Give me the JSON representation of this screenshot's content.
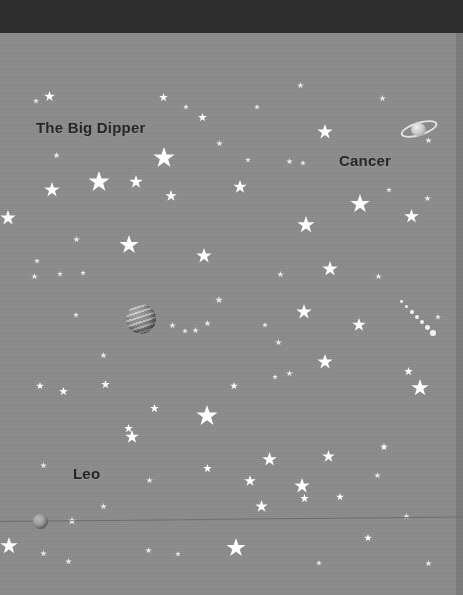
{
  "scene": {
    "title": "Night Sky Constellation Scene",
    "width": 463,
    "height": 595,
    "background_color": "#8b8b8c",
    "top_band_color": "#2e2e2e",
    "right_strip_color": "#7c7c7d",
    "star_color": "#fdfdfd",
    "label_color": "#262628"
  },
  "top_band": {
    "height": 33
  },
  "horizon": {
    "name": "horizon-line",
    "color": "#6e6e70",
    "y": 521,
    "slope_deg": -0.55,
    "thickness": 1
  },
  "labels": [
    {
      "text": "The Big Dipper",
      "x": 36,
      "y": 119,
      "size": 15
    },
    {
      "text": "Cancer",
      "x": 339,
      "y": 152,
      "size": 15
    },
    {
      "text": "Leo",
      "x": 73,
      "y": 465,
      "size": 15
    }
  ],
  "planets": [
    {
      "name": "banded-planet",
      "kind": "banded",
      "x": 126,
      "y": 304,
      "size": 30
    },
    {
      "name": "small-moon",
      "kind": "plain",
      "x": 33,
      "y": 514,
      "size": 15
    }
  ],
  "ringed_planet": {
    "name": "ringed-planet",
    "x": 400,
    "y": 116,
    "width": 38,
    "height": 26
  },
  "comet_trail": {
    "name": "comet-trail",
    "x": 400,
    "y": 300,
    "dots": [
      {
        "dx": 0,
        "dy": 0,
        "r": 1.4
      },
      {
        "dx": 5,
        "dy": 5,
        "r": 1.6
      },
      {
        "dx": 10,
        "dy": 10,
        "r": 1.8
      },
      {
        "dx": 15,
        "dy": 15,
        "r": 2.0
      },
      {
        "dx": 20,
        "dy": 20,
        "r": 2.2
      },
      {
        "dx": 25,
        "dy": 25,
        "r": 2.4
      },
      {
        "dx": 30,
        "dy": 30,
        "r": 2.8
      }
    ]
  },
  "stars": [
    {
      "x": 33,
      "y": 98,
      "s": 6,
      "dim": true
    },
    {
      "x": 44,
      "y": 91,
      "s": 11
    },
    {
      "x": 159,
      "y": 93,
      "s": 9
    },
    {
      "x": 183,
      "y": 104,
      "s": 6,
      "dim": true
    },
    {
      "x": 198,
      "y": 113,
      "s": 9
    },
    {
      "x": 254,
      "y": 104,
      "s": 6,
      "dim": true
    },
    {
      "x": 297,
      "y": 82,
      "s": 7,
      "dim": true
    },
    {
      "x": 317,
      "y": 124,
      "s": 16
    },
    {
      "x": 379,
      "y": 95,
      "s": 7,
      "dim": true
    },
    {
      "x": 53,
      "y": 152,
      "s": 7,
      "dim": true
    },
    {
      "x": 153,
      "y": 147,
      "s": 22
    },
    {
      "x": 216,
      "y": 140,
      "s": 7,
      "dim": true
    },
    {
      "x": 233,
      "y": 180,
      "s": 14
    },
    {
      "x": 245,
      "y": 157,
      "s": 6,
      "dim": true
    },
    {
      "x": 286,
      "y": 158,
      "s": 7,
      "dim": true
    },
    {
      "x": 300,
      "y": 160,
      "s": 6,
      "dim": true
    },
    {
      "x": 425,
      "y": 137,
      "s": 7,
      "dim": true
    },
    {
      "x": 88,
      "y": 171,
      "s": 22
    },
    {
      "x": 44,
      "y": 182,
      "s": 16
    },
    {
      "x": 129,
      "y": 175,
      "s": 14
    },
    {
      "x": 165,
      "y": 190,
      "s": 12
    },
    {
      "x": 350,
      "y": 194,
      "s": 20
    },
    {
      "x": 386,
      "y": 187,
      "s": 6,
      "dim": true
    },
    {
      "x": 424,
      "y": 195,
      "s": 7,
      "dim": true
    },
    {
      "x": 0,
      "y": 210,
      "s": 16
    },
    {
      "x": 297,
      "y": 216,
      "s": 18
    },
    {
      "x": 404,
      "y": 209,
      "s": 15
    },
    {
      "x": 119,
      "y": 235,
      "s": 20
    },
    {
      "x": 73,
      "y": 236,
      "s": 7,
      "dim": true
    },
    {
      "x": 196,
      "y": 248,
      "s": 16
    },
    {
      "x": 277,
      "y": 271,
      "s": 7,
      "dim": true
    },
    {
      "x": 322,
      "y": 261,
      "s": 16
    },
    {
      "x": 375,
      "y": 273,
      "s": 7,
      "dim": true
    },
    {
      "x": 34,
      "y": 258,
      "s": 6,
      "dim": true
    },
    {
      "x": 57,
      "y": 271,
      "s": 6,
      "dim": true
    },
    {
      "x": 80,
      "y": 270,
      "s": 6,
      "dim": true
    },
    {
      "x": 31,
      "y": 273,
      "s": 7,
      "dim": true
    },
    {
      "x": 215,
      "y": 296,
      "s": 8,
      "dim": true
    },
    {
      "x": 296,
      "y": 304,
      "s": 16
    },
    {
      "x": 169,
      "y": 322,
      "s": 7,
      "dim": true
    },
    {
      "x": 192,
      "y": 327,
      "s": 7,
      "dim": true
    },
    {
      "x": 204,
      "y": 320,
      "s": 7,
      "dim": true
    },
    {
      "x": 262,
      "y": 322,
      "s": 6,
      "dim": true
    },
    {
      "x": 275,
      "y": 339,
      "s": 7,
      "dim": true
    },
    {
      "x": 352,
      "y": 318,
      "s": 14
    },
    {
      "x": 435,
      "y": 314,
      "s": 6,
      "dim": true
    },
    {
      "x": 73,
      "y": 312,
      "s": 6,
      "dim": true
    },
    {
      "x": 100,
      "y": 352,
      "s": 7,
      "dim": true
    },
    {
      "x": 182,
      "y": 328,
      "s": 6,
      "dim": true
    },
    {
      "x": 101,
      "y": 380,
      "s": 9
    },
    {
      "x": 59,
      "y": 387,
      "s": 9
    },
    {
      "x": 150,
      "y": 404,
      "s": 9
    },
    {
      "x": 36,
      "y": 382,
      "s": 8
    },
    {
      "x": 196,
      "y": 405,
      "s": 22
    },
    {
      "x": 230,
      "y": 382,
      "s": 8
    },
    {
      "x": 317,
      "y": 354,
      "s": 16
    },
    {
      "x": 286,
      "y": 370,
      "s": 7,
      "dim": true
    },
    {
      "x": 272,
      "y": 374,
      "s": 6,
      "dim": true
    },
    {
      "x": 404,
      "y": 367,
      "s": 9
    },
    {
      "x": 411,
      "y": 379,
      "s": 18
    },
    {
      "x": 124,
      "y": 424,
      "s": 9
    },
    {
      "x": 125,
      "y": 430,
      "s": 14
    },
    {
      "x": 40,
      "y": 462,
      "s": 7,
      "dim": true
    },
    {
      "x": 203,
      "y": 464,
      "s": 9
    },
    {
      "x": 262,
      "y": 452,
      "s": 15
    },
    {
      "x": 322,
      "y": 450,
      "s": 13
    },
    {
      "x": 380,
      "y": 443,
      "s": 8
    },
    {
      "x": 146,
      "y": 477,
      "s": 7,
      "dim": true
    },
    {
      "x": 244,
      "y": 475,
      "s": 12
    },
    {
      "x": 294,
      "y": 478,
      "s": 16
    },
    {
      "x": 374,
      "y": 472,
      "s": 7,
      "dim": true
    },
    {
      "x": 336,
      "y": 493,
      "s": 8
    },
    {
      "x": 300,
      "y": 494,
      "s": 9
    },
    {
      "x": 255,
      "y": 500,
      "s": 13
    },
    {
      "x": 100,
      "y": 503,
      "s": 7,
      "dim": true
    },
    {
      "x": 0,
      "y": 537,
      "s": 18
    },
    {
      "x": 40,
      "y": 550,
      "s": 7,
      "dim": true
    },
    {
      "x": 65,
      "y": 558,
      "s": 7,
      "dim": true
    },
    {
      "x": 145,
      "y": 547,
      "s": 7,
      "dim": true
    },
    {
      "x": 175,
      "y": 551,
      "s": 6,
      "dim": true
    },
    {
      "x": 226,
      "y": 538,
      "s": 20
    },
    {
      "x": 364,
      "y": 534,
      "s": 8
    },
    {
      "x": 425,
      "y": 560,
      "s": 7,
      "dim": true
    },
    {
      "x": 403,
      "y": 513,
      "s": 7,
      "dim": true
    },
    {
      "x": 316,
      "y": 560,
      "s": 6,
      "dim": true
    },
    {
      "x": 68,
      "y": 517,
      "s": 8
    }
  ]
}
